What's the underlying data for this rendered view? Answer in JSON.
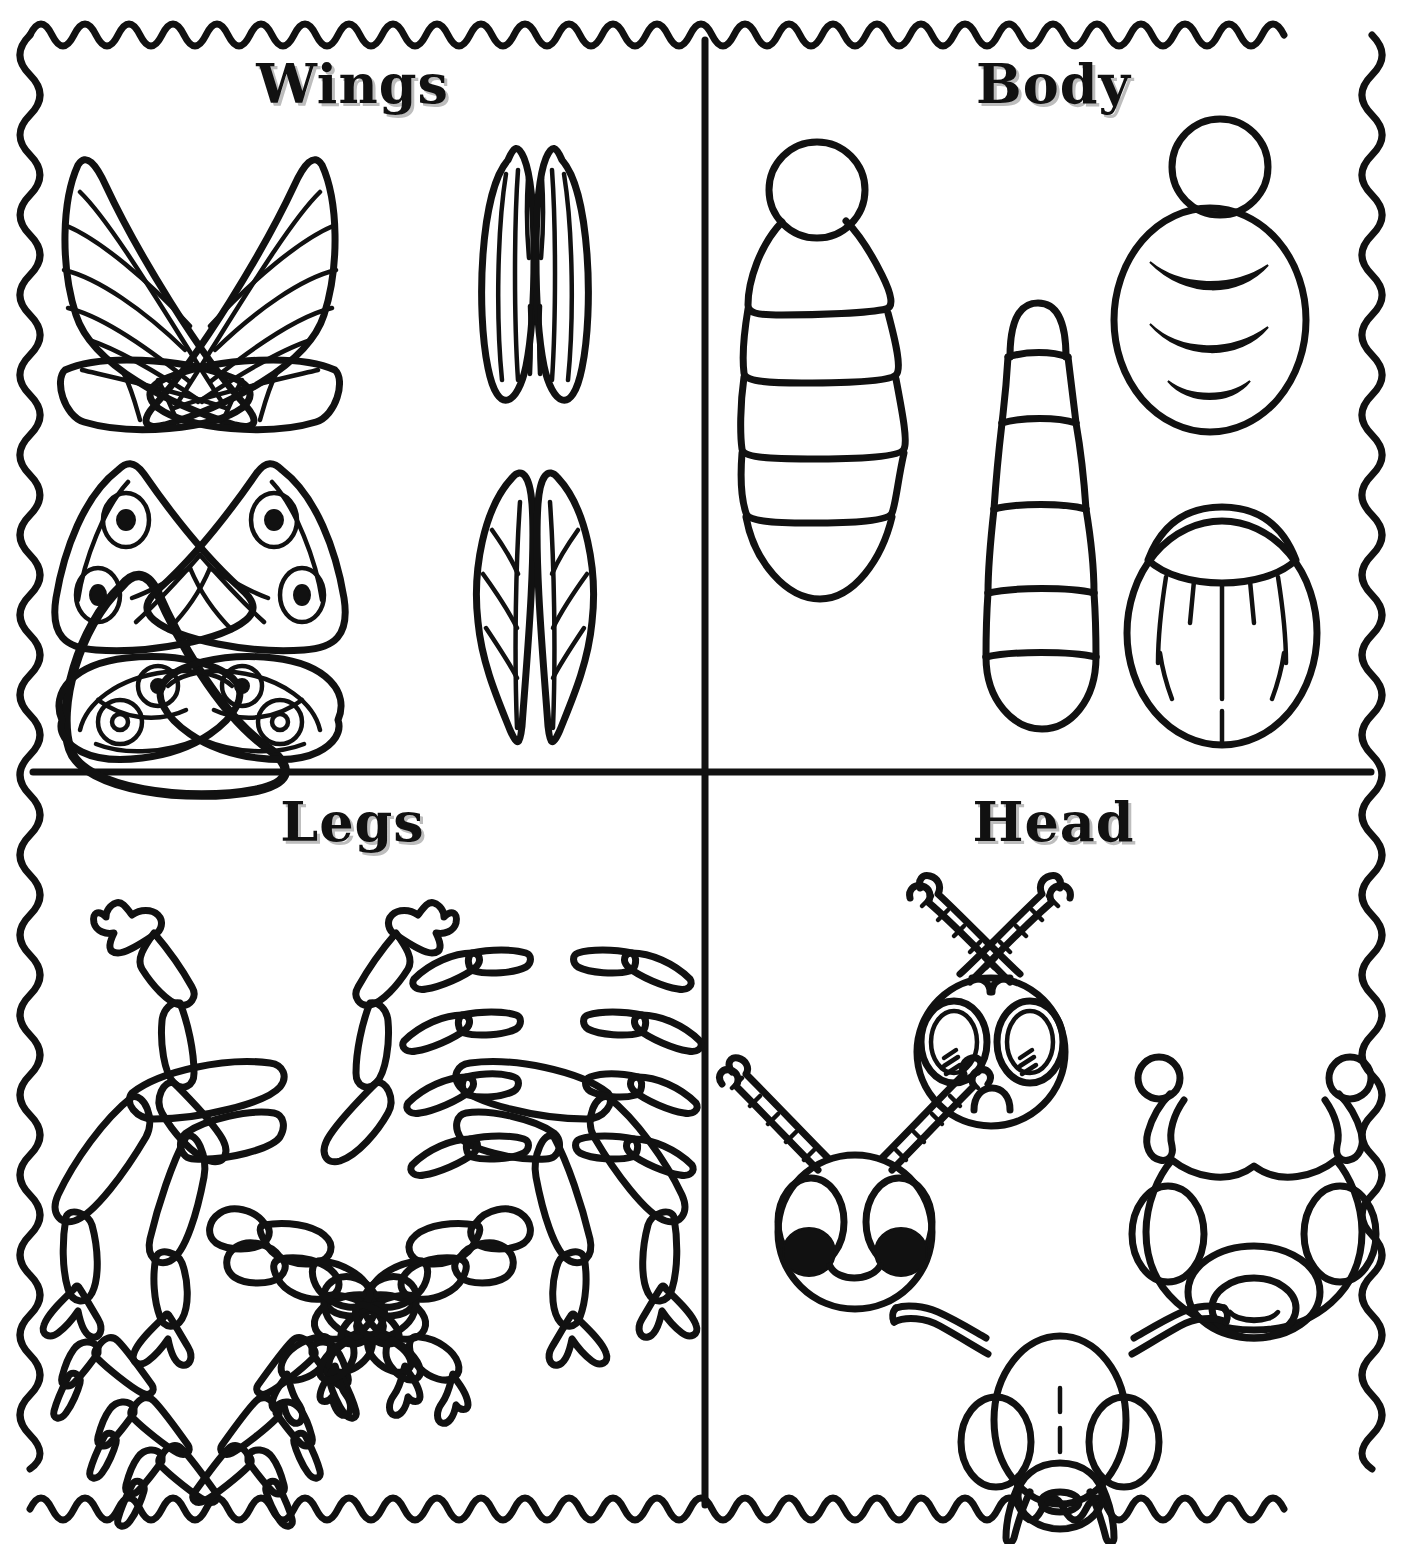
{
  "page": {
    "kind": "insect-parts-cut-out-worksheet",
    "background_color": "#ffffff",
    "ink_color": "#111111",
    "border_style": "wavy-zigzag-frame",
    "title_shadow_color": "#bdbdbd"
  },
  "quadrants": [
    {
      "id": "wings",
      "title": "Wings",
      "position": "top-left",
      "items": [
        {
          "name": "dragonfly-wing-pair-veined",
          "count": 4,
          "desc": "two upper pointed veined wings and two lower veined wings"
        },
        {
          "name": "striped-elytra-wing-pair",
          "count": 2,
          "desc": "two narrow oval wings with long vertical stripes"
        },
        {
          "name": "butterfly-wing-pair-eyespots",
          "count": 4,
          "desc": "two upper triangular wings and two lower rounded wings each with two eyespots"
        },
        {
          "name": "leaf-wing-pair",
          "count": 2,
          "desc": "two leaf shaped wings with midrib and branching veins"
        }
      ]
    },
    {
      "id": "body",
      "title": "Body",
      "position": "top-right",
      "items": [
        {
          "name": "segmented-bee-body",
          "count": 1,
          "desc": "round head with five tapering abdomen segments"
        },
        {
          "name": "elongated-segmented-abdomen",
          "count": 1,
          "desc": "tall narrow body with six segments"
        },
        {
          "name": "ladybug-oval-body",
          "count": 1,
          "desc": "oval body with small circular head and three crescent stripes"
        },
        {
          "name": "beetle-shell-body",
          "count": 1,
          "desc": "egg shaped body with domed pronotum and vertical stripe lines"
        }
      ]
    },
    {
      "id": "legs",
      "title": "Legs",
      "position": "bottom-left",
      "items": [
        {
          "name": "jointed-leg-pair-upper",
          "count": 2,
          "desc": "mirrored bent legs with claw feet"
        },
        {
          "name": "jointed-leg-pair-middle",
          "count": 4,
          "desc": "two mirrored pairs of thick jointed legs with forked feet"
        },
        {
          "name": "thin-curved-leg-set",
          "count": 8,
          "desc": "four rows of mirrored slim curved two-segment legs"
        },
        {
          "name": "angular-bent-leg-set",
          "count": 6,
          "desc": "three rows of mirrored sharply bent legs"
        },
        {
          "name": "beaded-segmented-leg-set",
          "count": 6,
          "desc": "three mirrored pairs of bumpy multi-segment legs with claws"
        }
      ]
    },
    {
      "id": "head",
      "title": "Head",
      "position": "bottom-right",
      "items": [
        {
          "name": "round-head-segmented-antennae",
          "count": 1,
          "desc": "round head, two large oval eyes with shine lines, small round mouth, long segmented antennae"
        },
        {
          "name": "smiling-head-black-pupils",
          "count": 1,
          "desc": "round head, oval eyes with solid black pupils, smile, segmented antennae"
        },
        {
          "name": "ant-head-club-antennae",
          "count": 1,
          "desc": "heart shaped ant head, oval side eyes, club tipped antennae, oval mouth with grin"
        },
        {
          "name": "mandible-head-straight-antennae",
          "count": 1,
          "desc": "oval head with dashed center line, oval eyes, round mouth, two pincers, straight bent antennae"
        }
      ]
    }
  ]
}
